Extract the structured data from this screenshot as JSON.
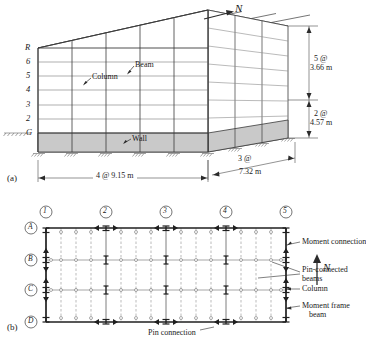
{
  "figure": {
    "subfigure_a_label": "(a)",
    "subfigure_b_label": "(b)",
    "north_label": "N"
  },
  "elevation": {
    "floor_labels": [
      "R",
      "6",
      "5",
      "4",
      "3",
      "2",
      "G"
    ],
    "part_labels": {
      "beam": "Beam",
      "column": "Column",
      "wall": "Wall"
    },
    "dimensions": {
      "right_upper_line1": "5 @",
      "right_upper_line2": "3.66 m",
      "right_lower_line1": "2 @",
      "right_lower_line2": "4.57 m",
      "bottom_front": "4 @  9.15 m",
      "bottom_side_line1": "3 @",
      "bottom_side_line2": "7.32 m"
    }
  },
  "plan": {
    "column_grid_labels": [
      "1",
      "2",
      "3",
      "4",
      "5"
    ],
    "row_grid_labels": [
      "A",
      "B",
      "C",
      "D"
    ],
    "callouts": {
      "moment_connection": "Moment connection",
      "pin_connected_beams_line1": "Pin-connected",
      "pin_connected_beams_line2": "beams",
      "column": "Column",
      "moment_frame_beam_line1": "Moment frame",
      "moment_frame_beam_line2": "beam",
      "pin_connection": "Pin connection"
    }
  },
  "colors": {
    "line": "#2b2b2b",
    "light_line": "#8c8c8c",
    "wall_fill": "#c9c9c9",
    "paper": "#ffffff"
  }
}
